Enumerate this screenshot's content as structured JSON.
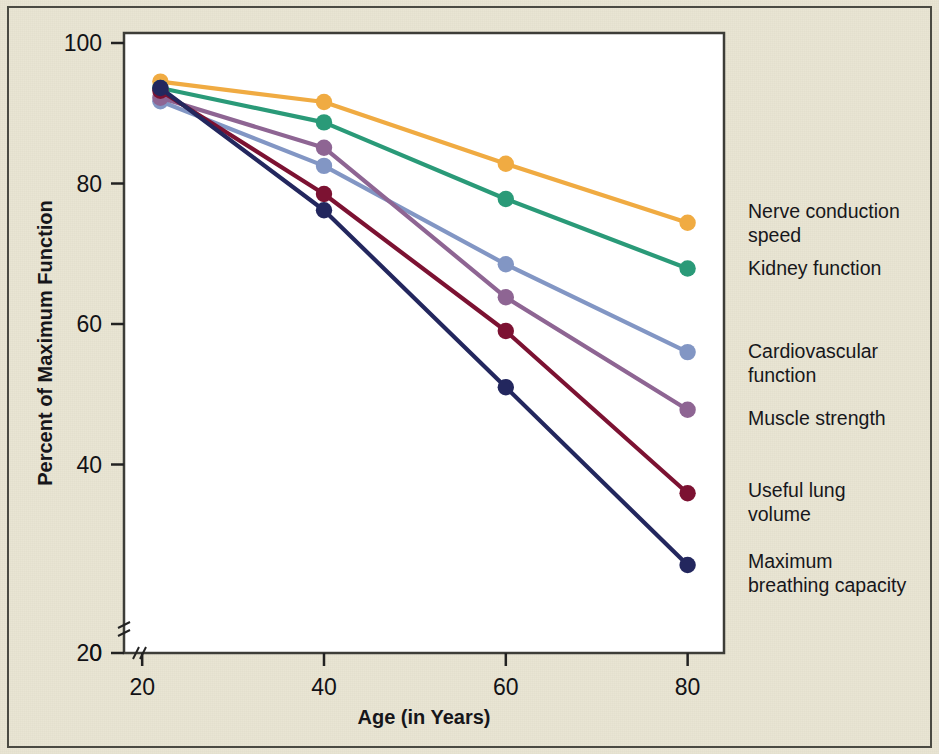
{
  "figure": {
    "background_color": "#e9e5d2",
    "plot_background_color": "#ffffff",
    "frame_color": "#4a4a42"
  },
  "chart_data": {
    "type": "line",
    "title": "",
    "xlabel": "Age (in Years)",
    "ylabel": "Percent of Maximum Function",
    "x": [
      22,
      40,
      60,
      80
    ],
    "xlim": [
      18,
      84
    ],
    "ylim": [
      0,
      100
    ],
    "xticks": [
      20,
      40,
      60,
      80
    ],
    "yticks": [
      0,
      20,
      40,
      60,
      80,
      100
    ],
    "xtick_labels": [
      "20",
      "40",
      "60",
      "80"
    ],
    "ytick_labels": [
      "0",
      "20",
      "40",
      "60",
      "80",
      "100"
    ],
    "grid": false,
    "axis_break_x": true,
    "axis_break_y": true,
    "legend_position": "right-inline",
    "marker": "circle",
    "series": [
      {
        "name": "Nerve conduction speed",
        "color": "#f0ab42",
        "values": [
          94.5,
          91.6,
          82.8,
          74.4
        ]
      },
      {
        "name": "Kidney function",
        "color": "#2a9a78",
        "values": [
          93.6,
          88.7,
          77.8,
          67.9
        ]
      },
      {
        "name": "Cardiovascular function",
        "color": "#8296c4",
        "values": [
          91.7,
          82.5,
          68.5,
          56.0
        ]
      },
      {
        "name": "Muscle strength",
        "color": "#8e6593",
        "values": [
          92.2,
          85.1,
          63.8,
          47.8
        ]
      },
      {
        "name": "Useful lung volume",
        "color": "#7c1232",
        "values": [
          93.2,
          78.5,
          59.0,
          35.9
        ]
      },
      {
        "name": "Maximum breathing capacity",
        "color": "#23275e",
        "values": [
          93.6,
          76.2,
          51.0,
          25.7
        ]
      }
    ]
  },
  "legend": {
    "entries": [
      {
        "label_line1": "Nerve conduction",
        "label_line2": "speed"
      },
      {
        "label_line1": "Kidney function",
        "label_line2": ""
      },
      {
        "label_line1": "Cardiovascular",
        "label_line2": "function"
      },
      {
        "label_line1": "Muscle strength",
        "label_line2": ""
      },
      {
        "label_line1": "Useful lung",
        "label_line2": "volume"
      },
      {
        "label_line1": "Maximum",
        "label_line2": "breathing capacity"
      }
    ]
  }
}
